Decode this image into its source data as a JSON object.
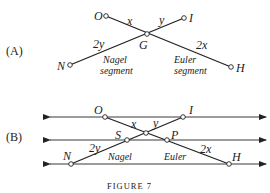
{
  "figure": {
    "caption": "FIGURE 7",
    "panelA": {
      "label": "(A)",
      "points": {
        "O": "O",
        "I": "I",
        "G": "G",
        "N": "N",
        "H": "H"
      },
      "segment_labels": {
        "x": "x",
        "y": "y",
        "two_y": "2y",
        "two_x": "2x"
      },
      "nagel_line1": "Nagel",
      "nagel_line2": "segment",
      "euler_line1": "Euler",
      "euler_line2": "segment"
    },
    "panelB": {
      "label": "(B)",
      "points": {
        "O": "O",
        "I": "I",
        "S": "S",
        "P": "P",
        "N": "N",
        "H": "H"
      },
      "segment_labels": {
        "x": "x",
        "y": "y",
        "two_y": "2y",
        "two_x": "2x"
      },
      "nagel": "Nagel",
      "euler": "Euler"
    }
  }
}
